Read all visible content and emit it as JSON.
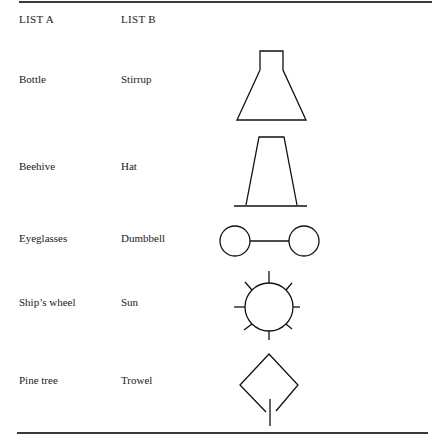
{
  "headers": {
    "list_a": "LIST A",
    "list_b": "LIST B"
  },
  "rows": [
    {
      "a": "Bottle",
      "b": "Stirrup",
      "figure": "stirrup-shape-icon"
    },
    {
      "a": "Beehive",
      "b": "Hat",
      "figure": "hat-shape-icon"
    },
    {
      "a": "Eyeglasses",
      "b": "Dumbbell",
      "figure": "dumbbell-shape-icon"
    },
    {
      "a": "Ship’s wheel",
      "b": "Sun",
      "figure": "sun-shape-icon"
    },
    {
      "a": "Pine tree",
      "b": "Trowel",
      "figure": "trowel-shape-icon"
    }
  ]
}
